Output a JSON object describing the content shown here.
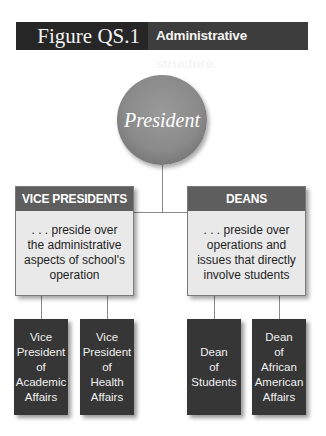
{
  "figure": {
    "number": "Figure QS.1",
    "caption": "Administrative structure."
  },
  "top": {
    "label": "President"
  },
  "groups": [
    {
      "title": "VICE PRESIDENTS",
      "description": ". . . preside over the administrative aspects of school's operation",
      "roles": [
        "Vice\nPresident\nof\nAcademic\nAffairs",
        "Vice\nPresident\nof\nHealth\nAffairs"
      ]
    },
    {
      "title": "DEANS",
      "description": ". . . preside over operations and issues that directly involve students",
      "roles": [
        "Dean\nof\nStudents",
        "Dean\nof\nAfrican\nAmerican\nAffairs"
      ]
    }
  ],
  "colors": {
    "header_dark": "#262626",
    "header_mid": "#3d3d3d",
    "circle": "#8a8a8a",
    "group_head": "#5e5e5e",
    "group_body": "#e9e9e9",
    "role_box": "#363636"
  }
}
